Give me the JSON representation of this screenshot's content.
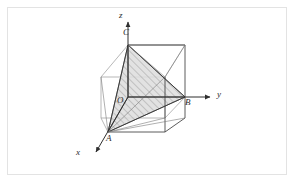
{
  "figure": {
    "kind": "3d-geometry-diagram",
    "frame": {
      "border_color": "#e3e3e3",
      "background": "#ffffff"
    },
    "colors": {
      "solid_line": "#3b3b3b",
      "thin_line": "#8a8a8a",
      "axis": "#2f2f2f",
      "hatch": "#8e8e8e",
      "shade_fill": "#d9d9d9",
      "label_text": "#2b2b2b"
    },
    "axes": [
      {
        "name": "z-axis",
        "label": "z",
        "label_x": 120,
        "label_y": 15,
        "from": [
          128,
          97
        ],
        "to": [
          128,
          20
        ],
        "arrow": true
      },
      {
        "name": "y-axis",
        "label": "y",
        "label_x": 219,
        "label_y": 91,
        "from": [
          128,
          97
        ],
        "to": [
          212,
          97
        ],
        "arrow": true
      },
      {
        "name": "x-axis",
        "label": "x",
        "label_x": 78,
        "label_y": 152,
        "from": [
          128,
          97
        ],
        "to": [
          94,
          155
        ],
        "arrow": true
      }
    ],
    "points": [
      {
        "name": "origin",
        "label": "O",
        "x": 128,
        "y": 97,
        "label_x": 118,
        "label_y": 98
      },
      {
        "name": "vertex-a",
        "label": "A",
        "x": 108,
        "y": 132,
        "label_x": 108,
        "label_y": 137
      },
      {
        "name": "vertex-b",
        "label": "B",
        "x": 185,
        "y": 97,
        "label_x": 186,
        "label_y": 100
      },
      {
        "name": "vertex-c",
        "label": "C",
        "x": 128,
        "y": 45,
        "label_x": 124,
        "label_y": 29
      }
    ],
    "cube": {
      "vertices": {
        "front_top_left": [
          128,
          45
        ],
        "front_top_right": [
          185,
          45
        ],
        "front_bottom_left": [
          128,
          97
        ],
        "front_bottom_right": [
          185,
          97
        ],
        "back_top_left": [
          101,
          77
        ],
        "back_top_right": [
          165,
          77
        ],
        "back_bottom_left": [
          101,
          118
        ],
        "back_bottom_right": [
          165,
          118
        ],
        "lower_front_left": [
          108,
          132
        ],
        "lower_front_right": [
          165,
          132
        ],
        "lower_right": [
          185,
          118
        ]
      }
    },
    "shaded_triangle": {
      "name": "triangle-acb",
      "vertex_labels": [
        "A",
        "C",
        "B"
      ],
      "points": "108,132 128,45 185,97"
    }
  }
}
